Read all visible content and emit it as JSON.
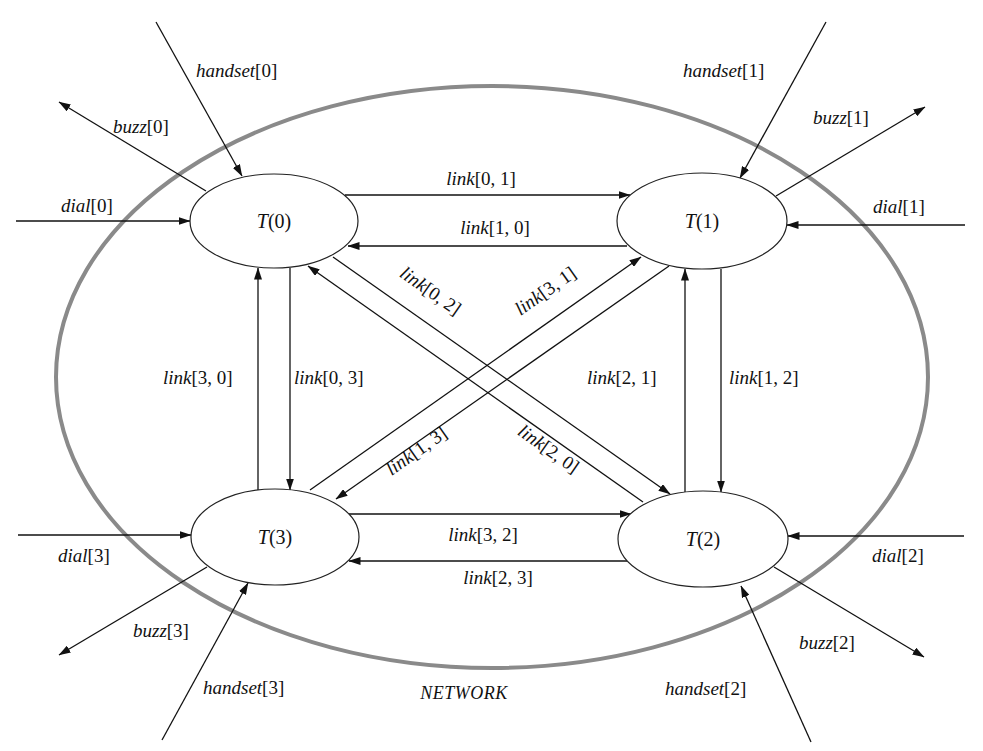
{
  "diagram": {
    "type": "network-block-diagram",
    "network_label": "NETWORK",
    "colors": {
      "network_boundary": "#8a8a8a",
      "lines": "#111111",
      "node_fill": "#ffffff"
    },
    "nodes": [
      {
        "id": "T0",
        "name": "T",
        "index": "(0)"
      },
      {
        "id": "T1",
        "name": "T",
        "index": "(1)"
      },
      {
        "id": "T2",
        "name": "T",
        "index": "(2)"
      },
      {
        "id": "T3",
        "name": "T",
        "index": "(3)"
      }
    ],
    "external": {
      "handset0": {
        "name": "handset",
        "idx": "[0]",
        "direction": "in",
        "target": "T0"
      },
      "buzz0": {
        "name": "buzz",
        "idx": "[0]",
        "direction": "out",
        "source": "T0"
      },
      "dial0": {
        "name": "dial",
        "idx": "[0]",
        "direction": "in",
        "target": "T0"
      },
      "handset1": {
        "name": "handset",
        "idx": "[1]",
        "direction": "in",
        "target": "T1"
      },
      "buzz1": {
        "name": "buzz",
        "idx": "[1]",
        "direction": "out",
        "source": "T1"
      },
      "dial1": {
        "name": "dial",
        "idx": "[1]",
        "direction": "in",
        "target": "T1"
      },
      "handset2": {
        "name": "handset",
        "idx": "[2]",
        "direction": "in",
        "target": "T2"
      },
      "buzz2": {
        "name": "buzz",
        "idx": "[2]",
        "direction": "out",
        "source": "T2"
      },
      "dial2": {
        "name": "dial",
        "idx": "[2]",
        "direction": "in",
        "target": "T2"
      },
      "handset3": {
        "name": "handset",
        "idx": "[3]",
        "direction": "in",
        "target": "T3"
      },
      "buzz3": {
        "name": "buzz",
        "idx": "[3]",
        "direction": "out",
        "source": "T3"
      },
      "dial3": {
        "name": "dial",
        "idx": "[3]",
        "direction": "in",
        "target": "T3"
      }
    },
    "links": {
      "l01": {
        "name": "link",
        "idx": "[0, 1]",
        "from": "T0",
        "to": "T1"
      },
      "l10": {
        "name": "link",
        "idx": "[1, 0]",
        "from": "T1",
        "to": "T0"
      },
      "l32": {
        "name": "link",
        "idx": "[3, 2]",
        "from": "T3",
        "to": "T2"
      },
      "l23": {
        "name": "link",
        "idx": "[2, 3]",
        "from": "T2",
        "to": "T3"
      },
      "l30": {
        "name": "link",
        "idx": "[3, 0]",
        "from": "T3",
        "to": "T0"
      },
      "l03": {
        "name": "link",
        "idx": "[0, 3]",
        "from": "T0",
        "to": "T3"
      },
      "l21": {
        "name": "link",
        "idx": "[2, 1]",
        "from": "T2",
        "to": "T1"
      },
      "l12": {
        "name": "link",
        "idx": "[1, 2]",
        "from": "T1",
        "to": "T2"
      },
      "l02": {
        "name": "link",
        "idx": "[0, 2]",
        "from": "T0",
        "to": "T2"
      },
      "l20": {
        "name": "link",
        "idx": "[2, 0]",
        "from": "T2",
        "to": "T0"
      },
      "l31": {
        "name": "link",
        "idx": "[3, 1]",
        "from": "T3",
        "to": "T1"
      },
      "l13": {
        "name": "link",
        "idx": "[1, 3]",
        "from": "T1",
        "to": "T3"
      }
    }
  }
}
